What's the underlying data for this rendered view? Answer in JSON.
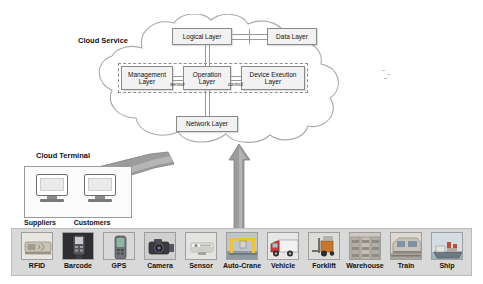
{
  "diagram": {
    "title_cloud_service": "Cloud Service",
    "title_cloud_terminal": "Cloud Terminal",
    "cloud_layers": [
      {
        "id": "logical-layer",
        "label": "Logical Layer"
      },
      {
        "id": "data-layer",
        "label": "Data Layer"
      },
      {
        "id": "management-layer",
        "label": "Management\nLayer"
      },
      {
        "id": "operation-layer",
        "label": "Operation\nLayer"
      },
      {
        "id": "device-execution-layer",
        "label": "Device Exeution\nLayer"
      },
      {
        "id": "network-layer",
        "label": "Network Layer"
      }
    ],
    "connector_labels": {
      "management_to_operation": "sensor",
      "operation_to_device": "control"
    },
    "terminals": [
      {
        "id": "suppliers",
        "label": "Suppliers"
      },
      {
        "id": "customers",
        "label": "Customers"
      }
    ],
    "devices": [
      {
        "id": "rfid",
        "label": "RFID",
        "icon": "rfid-tag-icon"
      },
      {
        "id": "barcode",
        "label": "Barcode",
        "icon": "barcode-scanner-icon"
      },
      {
        "id": "gps",
        "label": "GPS",
        "icon": "gps-handheld-icon"
      },
      {
        "id": "camera",
        "label": "Camera",
        "icon": "camera-icon"
      },
      {
        "id": "sensor",
        "label": "Sensor",
        "icon": "sensor-icon"
      },
      {
        "id": "auto-crane",
        "label": "Auto-Crane",
        "icon": "auto-crane-icon"
      },
      {
        "id": "vehicle",
        "label": "Vehicle",
        "icon": "truck-icon"
      },
      {
        "id": "forklift",
        "label": "Forklift",
        "icon": "forklift-icon"
      },
      {
        "id": "warehouse",
        "label": "Warehouse",
        "icon": "warehouse-icon"
      },
      {
        "id": "train",
        "label": "Train",
        "icon": "train-icon"
      },
      {
        "id": "ship",
        "label": "Ship",
        "icon": "ship-icon"
      }
    ],
    "colors": {
      "strip_background": "#d9d9d9",
      "box_fill": "#f2f2f2",
      "box_border": "#8a8a8a",
      "cloud_border": "#a8a8a8",
      "arrow_fill": "#9c9c9c"
    }
  }
}
